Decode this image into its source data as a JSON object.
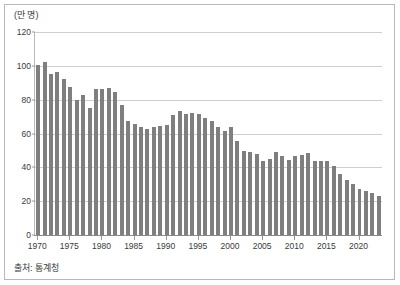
{
  "figure": {
    "unit_label": "(만 명)",
    "source_label": "출처: 통계청"
  },
  "chart_data": {
    "type": "bar",
    "title": "",
    "subtitle": "",
    "xlabel": "",
    "ylabel": "(만 명)",
    "unit": "만 명",
    "source": "출처: 통계청",
    "grid": true,
    "legend": null,
    "bar_color": "#7f7f7f",
    "ylim": [
      0,
      120
    ],
    "yticks": [
      0,
      20,
      40,
      60,
      80,
      100,
      120
    ],
    "xticks": [
      1970,
      1975,
      1980,
      1985,
      1990,
      1995,
      2000,
      2005,
      2010,
      2015,
      2020
    ],
    "xlim": [
      1969.5,
      2023.5
    ],
    "categories": [
      1970,
      1971,
      1972,
      1973,
      1974,
      1975,
      1976,
      1977,
      1978,
      1979,
      1980,
      1981,
      1982,
      1983,
      1984,
      1985,
      1986,
      1987,
      1988,
      1989,
      1990,
      1991,
      1992,
      1993,
      1994,
      1995,
      1996,
      1997,
      1998,
      1999,
      2000,
      2001,
      2002,
      2003,
      2004,
      2005,
      2006,
      2007,
      2008,
      2009,
      2010,
      2011,
      2012,
      2013,
      2014,
      2015,
      2016,
      2017,
      2018,
      2019,
      2020,
      2021,
      2022,
      2023
    ],
    "values": [
      100.7,
      102.4,
      95.2,
      96.5,
      92.3,
      87.4,
      79.7,
      82.5,
      75.1,
      86.3,
      86.3,
      86.7,
      84.8,
      77.0,
      67.4,
      65.5,
      63.7,
      62.4,
      63.7,
      64.6,
      65.0,
      70.9,
      73.1,
      71.6,
      72.1,
      71.5,
      69.1,
      67.5,
      64.1,
      61.4,
      64.0,
      55.5,
      49.7,
      49.0,
      47.6,
      43.5,
      45.2,
      49.3,
      46.6,
      44.5,
      47.0,
      47.1,
      48.5,
      43.7,
      43.5,
      43.8,
      40.6,
      35.8,
      32.7,
      30.3,
      27.2,
      26.1,
      24.9,
      23.0
    ]
  }
}
